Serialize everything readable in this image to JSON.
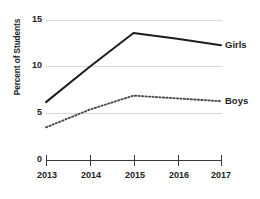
{
  "chart_data": {
    "type": "line",
    "title": "",
    "subtitle": "",
    "xlabel": "",
    "ylabel": "Percent of Students",
    "categories": [
      "2013",
      "2014",
      "2015",
      "2016",
      "2017"
    ],
    "x": [
      2013,
      2014,
      2015,
      2016,
      2017
    ],
    "xlim": [
      2013,
      2017
    ],
    "ylim": [
      0,
      15
    ],
    "y_ticks": [
      15,
      10,
      5,
      0
    ],
    "x_ticks": [
      "2013",
      "2014",
      "2015",
      "2016",
      "2017"
    ],
    "grid": true,
    "grid_axis": "y",
    "legend_position": "right-of-line-end",
    "series": [
      {
        "name": "Girls",
        "style": "solid",
        "color": "#1d1d1d",
        "values": [
          6.2,
          10.0,
          13.6,
          13.0,
          12.3
        ]
      },
      {
        "name": "Boys",
        "style": "dotted",
        "color": "#4a4a4a",
        "values": [
          3.5,
          5.4,
          6.9,
          6.6,
          6.3
        ]
      }
    ],
    "annotations": [
      {
        "text": "Girls",
        "attached_to": "Girls",
        "at_x": 2017
      },
      {
        "text": "Boys",
        "attached_to": "Boys",
        "at_x": 2017
      }
    ]
  },
  "axis": {
    "y_title": "Percent of Students",
    "y_labels": [
      "15",
      "10",
      "5",
      "0"
    ],
    "x_labels": [
      "2013",
      "2014",
      "2015",
      "2016",
      "2017"
    ]
  },
  "legend": {
    "girls_label": "Girls",
    "boys_label": "Boys"
  },
  "colors": {
    "girls_line": "#1d1d1d",
    "boys_line": "#4a4a4a",
    "grid": "#d8d8d8",
    "axis": "#3a3a3a",
    "text": "#232323",
    "background": "#ffffff"
  }
}
